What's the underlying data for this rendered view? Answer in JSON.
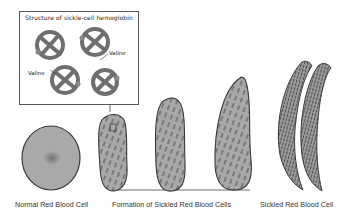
{
  "inset": {
    "title": "Structure of sickle-cell hemoglobin",
    "labels": [
      "Valine",
      "Valine"
    ]
  },
  "captions": {
    "normal": "Normal Red Blood Cell",
    "formation": "Formation of Sickled Red Blood Cells",
    "sickled": "Sickled Red Blood Cell"
  },
  "colors": {
    "cell_fill": "#a9a9a9",
    "cell_outline": "#3a3a3a",
    "hemoglobin": "#7a7a7a",
    "text": "#333333"
  }
}
